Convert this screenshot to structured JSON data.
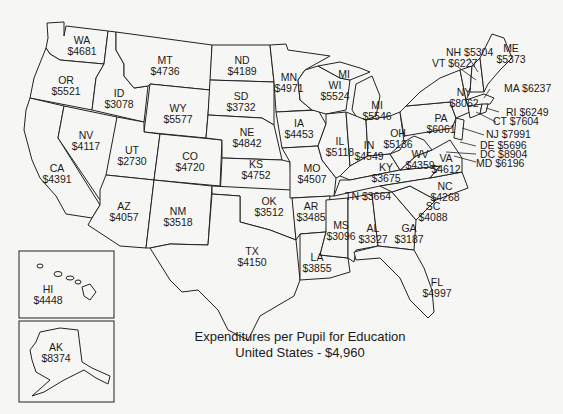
{
  "title": {
    "line1": "Expenditures per Pupil for Education",
    "line2": "United States - $4,960"
  },
  "states": {
    "WA": {
      "abbr": "WA",
      "value": "$4681"
    },
    "OR": {
      "abbr": "OR",
      "value": "$5521"
    },
    "CA": {
      "abbr": "CA",
      "value": "$4391"
    },
    "ID": {
      "abbr": "ID",
      "value": "$3078"
    },
    "NV": {
      "abbr": "NV",
      "value": "$4117"
    },
    "MT": {
      "abbr": "MT",
      "value": "$4736"
    },
    "WY": {
      "abbr": "WY",
      "value": "$5577"
    },
    "UT": {
      "abbr": "UT",
      "value": "$2730"
    },
    "CO": {
      "abbr": "CO",
      "value": "$4720"
    },
    "AZ": {
      "abbr": "AZ",
      "value": "$4057"
    },
    "NM": {
      "abbr": "NM",
      "value": "$3518"
    },
    "ND": {
      "abbr": "ND",
      "value": "$4189"
    },
    "SD": {
      "abbr": "SD",
      "value": "$3732"
    },
    "NE": {
      "abbr": "NE",
      "value": "$4842"
    },
    "KS": {
      "abbr": "KS",
      "value": "$4752"
    },
    "OK": {
      "abbr": "OK",
      "value": "$3512"
    },
    "TX": {
      "abbr": "TX",
      "value": "$4150"
    },
    "MN": {
      "abbr": "MN",
      "value": "$4971"
    },
    "IA": {
      "abbr": "IA",
      "value": "$4453"
    },
    "MO": {
      "abbr": "MO",
      "value": "$4507"
    },
    "AR": {
      "abbr": "AR",
      "value": "$3485"
    },
    "LA": {
      "abbr": "LA",
      "value": "$3855"
    },
    "WI": {
      "abbr": "WI",
      "value": "$5524"
    },
    "MI_UP": {
      "abbr": "MI"
    },
    "MI": {
      "abbr": "MI",
      "value": "$5546"
    },
    "IL": {
      "abbr": "IL",
      "value": "$5118"
    },
    "IN": {
      "abbr": "IN",
      "value": "$4549"
    },
    "OH": {
      "abbr": "OH",
      "value": "$5136"
    },
    "KY": {
      "abbr": "KY",
      "value": "$3675"
    },
    "TN": {
      "abbr": "TN",
      "value": "$3664"
    },
    "MS": {
      "abbr": "MS",
      "value": "$3096"
    },
    "AL": {
      "abbr": "AL",
      "value": "$3327"
    },
    "GA": {
      "abbr": "GA",
      "value": "$3187"
    },
    "FL": {
      "abbr": "FL",
      "value": "$4997"
    },
    "SC": {
      "abbr": "SC",
      "value": "$4088"
    },
    "NC": {
      "abbr": "NC",
      "value": "$4268"
    },
    "VA": {
      "abbr": "VA",
      "value": "$4612"
    },
    "WV": {
      "abbr": "WV",
      "value": "$4359"
    },
    "PA": {
      "abbr": "PA",
      "value": "$6061"
    },
    "NY": {
      "abbr": "NY",
      "value": "$8062"
    },
    "ME": {
      "abbr": "ME",
      "value": "$5373"
    },
    "NH": {
      "label": "NH $5304"
    },
    "VT": {
      "label": "VT $6227"
    },
    "MA": {
      "label": "MA $6237"
    },
    "RI": {
      "label": "RI $6249"
    },
    "CT": {
      "label": "CT $7604"
    },
    "NJ": {
      "label": "NJ $7991"
    },
    "DE": {
      "label": "DE $5696"
    },
    "DC": {
      "label": "DC $8904"
    },
    "MD": {
      "label": "MD $6196"
    },
    "HI": {
      "abbr": "HI",
      "value": "$4448"
    },
    "AK": {
      "abbr": "AK",
      "value": "$8374"
    }
  }
}
